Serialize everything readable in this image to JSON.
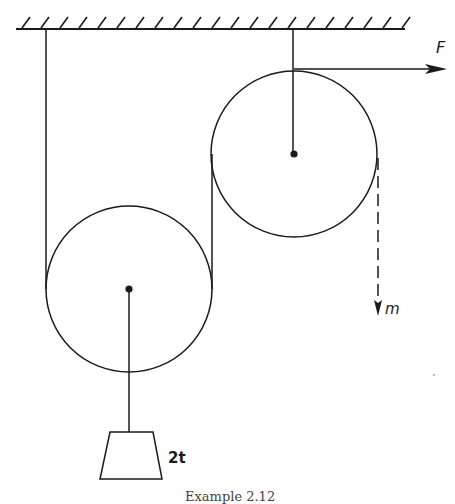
{
  "figure": {
    "type": "pulley-system",
    "ceiling": {
      "hatch_count": 21
    },
    "pulleys": [
      {
        "name": "lower-left-pulley",
        "cx": 129,
        "cy": 289,
        "r": 83
      },
      {
        "name": "upper-right-pulley",
        "cx": 294,
        "cy": 154,
        "r": 83
      }
    ],
    "load": {
      "label": "2t"
    },
    "force": {
      "label": "F"
    },
    "dashed_path": {
      "label": "m"
    },
    "caption": "Example 2.12"
  },
  "colors": {
    "ink": "#1a1a1a",
    "background": "#ffffff"
  }
}
